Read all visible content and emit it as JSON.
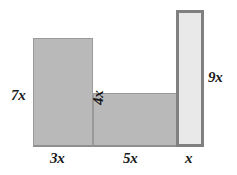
{
  "figure": {
    "type": "composite-rectangle-diagram",
    "background_color": "#ffffff"
  },
  "colors": {
    "gray_fill": "#b9b9b9",
    "gray_border": "#9a9a9a",
    "light_fill": "#e9e9e9",
    "light_border": "#808080",
    "label_text": "#1a1a1a"
  },
  "shapes": [
    {
      "id": "rect-left",
      "name": "left-tall-rectangle",
      "fill": "#b9b9b9",
      "width_label": "3x",
      "height_label": "7x"
    },
    {
      "id": "rect-middle",
      "name": "middle-horizontal-rectangle",
      "fill": "#b9b9b9",
      "width_label": "5x",
      "height_label": "4x"
    },
    {
      "id": "rect-right",
      "name": "right-tall-rectangle",
      "fill": "#e9e9e9",
      "width_label": "x",
      "height_label": "9x"
    }
  ],
  "labels": {
    "left_height": "7x",
    "middle_height": "4x",
    "right_height": "9x",
    "left_width": "3x",
    "middle_width": "5x",
    "right_width": "x"
  }
}
